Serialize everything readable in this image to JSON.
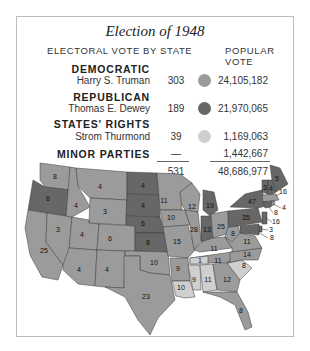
{
  "title": "Election of 1948",
  "headers": {
    "electoral": "ELECTORAL VOTE BY STATE",
    "popular": "POPULAR VOTE"
  },
  "colors": {
    "democratic": "#9b9b9b",
    "republican": "#676767",
    "states_rights": "#cfcfcf",
    "border": "#3a3a3a"
  },
  "parties": [
    {
      "party": "DEMOCRATIC",
      "candidate": "Harry S. Truman",
      "electoral": "303",
      "popular": "24,105,182",
      "color": "democratic"
    },
    {
      "party": "REPUBLICAN",
      "candidate": "Thomas E. Dewey",
      "electoral": "189",
      "popular": "21,970,065",
      "color": "republican"
    },
    {
      "party": "STATES' RIGHTS",
      "candidate": "Strom Thurmond",
      "electoral": "39",
      "popular": "1,169,063",
      "color": "states_rights"
    },
    {
      "party": "MINOR PARTIES",
      "candidate": "",
      "electoral": "—",
      "popular": "1,442,667",
      "color": ""
    }
  ],
  "totals": {
    "electoral": "531",
    "popular": "48,686,977"
  },
  "map_labels": {
    "WA": "8",
    "OR": "6",
    "CA": "25",
    "ID": "4",
    "NV": "3",
    "MT": "4",
    "WY": "3",
    "UT": "4",
    "AZ": "4",
    "CO": "6",
    "NM": "4",
    "ND": "4",
    "SD": "4",
    "NE": "6",
    "KS": "8",
    "OK": "10",
    "TX": "23",
    "MN": "11",
    "IA": "10",
    "MO": "15",
    "AR": "9",
    "LA": "10",
    "WI": "12",
    "IL": "28",
    "MI": "19",
    "IN": "13",
    "OH": "25",
    "KY": "11",
    "TN_split": "1",
    "TN": "11",
    "MS": "9",
    "AL": "11",
    "GA": "12",
    "FL": "8",
    "SC": "8",
    "NC": "14",
    "VA": "11",
    "WV": "8",
    "PA": "35",
    "NY": "47",
    "ME": "5",
    "VT": "3",
    "NH": "4",
    "MA": "16",
    "RI": "4",
    "CT": "8",
    "NJ": "16",
    "DE": "3",
    "MD": "8"
  }
}
